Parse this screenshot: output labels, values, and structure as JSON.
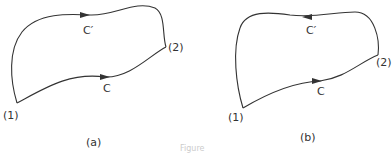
{
  "diagrams": [
    {
      "id": "a",
      "caption": "(a)",
      "points": {
        "start": "(1)",
        "end": "(2)"
      },
      "paths": [
        {
          "name": "C",
          "label": "C",
          "direction": "from (1) to (2)"
        },
        {
          "name": "C'",
          "label": "C′",
          "direction": "from (1) to (2)"
        }
      ]
    },
    {
      "id": "b",
      "caption": "(b)",
      "points": {
        "start": "(1)",
        "end": "(2)"
      },
      "paths": [
        {
          "name": "C",
          "label": "C",
          "direction": "from (1) to (2)"
        },
        {
          "name": "C'",
          "label": "C′",
          "direction": "from (2) to (1)"
        }
      ]
    }
  ],
  "figure_caption": "Figure",
  "colors": {
    "line": "#333333",
    "text": "#333333"
  }
}
